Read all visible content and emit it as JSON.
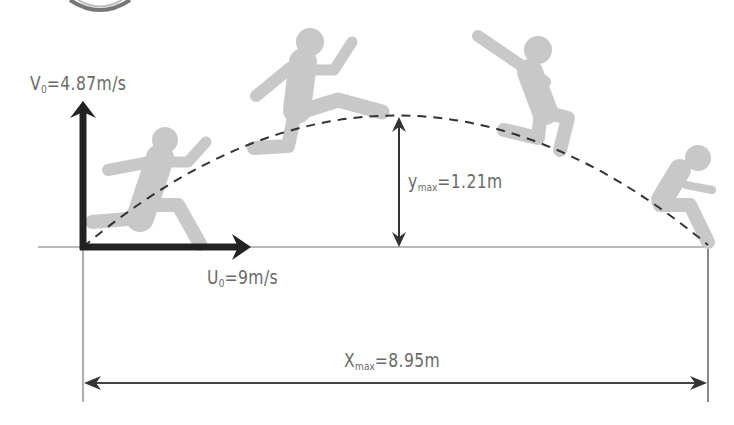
{
  "diagram": {
    "labels": {
      "v0": {
        "symbol": "V",
        "sub": "0",
        "value": "=4.87m/s"
      },
      "u0": {
        "symbol": "U",
        "sub": "0",
        "value": "=9m/s"
      },
      "ymax": {
        "symbol": "y",
        "sub": "max",
        "value": "=1.21m"
      },
      "xmax": {
        "symbol": "X",
        "sub": "max",
        "value": "=8.95m"
      }
    },
    "colors": {
      "figure": "#c8c8c8",
      "arrow": "#222222",
      "line": "#555555",
      "text": "#6a6a6a"
    },
    "stages": [
      "takeoff",
      "flight-rising",
      "flight-falling",
      "landing"
    ]
  }
}
